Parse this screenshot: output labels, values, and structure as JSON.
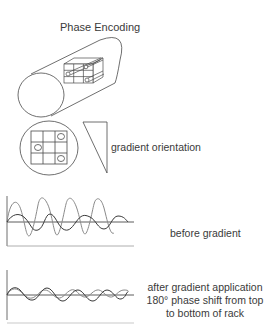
{
  "title": "Phase Encoding",
  "labels": {
    "gradient_orientation": "gradient orientation",
    "before_gradient": "before gradient",
    "after_line1": "after gradient application",
    "after_line2": "180° phase shift from top",
    "after_line3": "to bottom of rack"
  },
  "colors": {
    "line": "#4a4a4a",
    "wave_light": "#8a8a8a",
    "wave_dark": "#3a3a3a",
    "background": "#ffffff"
  },
  "figures": {
    "cylinder": {
      "description": "magnet bore cylinder with 3x3 rack of sample tubes"
    },
    "cross_section": {
      "grid": "3x3",
      "tubes_at": [
        "top-right",
        "middle-left",
        "bottom-right"
      ]
    },
    "gradient_wedge": {
      "orientation": "top-wide, pointing down"
    },
    "plot_before": {
      "waves": [
        "high-amplitude short-period",
        "low-amplitude long-period"
      ]
    },
    "plot_after": {
      "waves": [
        "low-amplitude in phase",
        "low-amplitude 180° shifted"
      ]
    }
  }
}
